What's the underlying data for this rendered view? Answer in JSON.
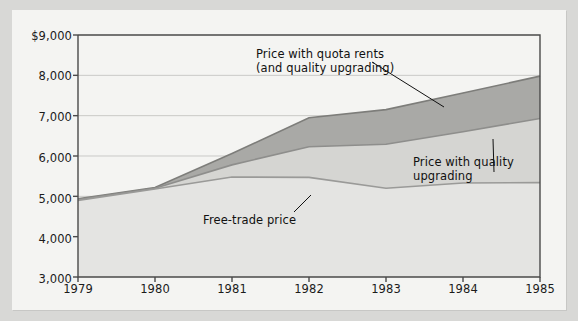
{
  "chart_data": {
    "type": "area",
    "title": "",
    "subtitle": "",
    "xlabel": "",
    "ylabel": "",
    "stacked": true,
    "grid": true,
    "legend_position": "inline-annotations",
    "x": [
      1979,
      1980,
      1981,
      1982,
      1983,
      1984,
      1985
    ],
    "categories": [
      "1979",
      "1980",
      "1981",
      "1982",
      "1983",
      "1984",
      "1985"
    ],
    "xlim": [
      1979,
      1985
    ],
    "ylim": [
      3000,
      9000
    ],
    "ytick_values": [
      3000,
      4000,
      5000,
      6000,
      7000,
      8000,
      9000
    ],
    "ytick_labels": [
      "3,000",
      "4,000",
      "5,000",
      "6,000",
      "7,000",
      "8,000",
      "$9,000"
    ],
    "xtick_labels": [
      "1979",
      "1980",
      "1981",
      "1982",
      "1983",
      "1984",
      "1985"
    ],
    "series": [
      {
        "name": "Free-trade price",
        "values": [
          4900,
          5180,
          5480,
          5470,
          5200,
          5330,
          5340
        ],
        "color": "#e4e4e2",
        "line_color": "#9a9a98"
      },
      {
        "name": "Price with quality upgrading",
        "values": [
          4920,
          5200,
          5780,
          6230,
          6290,
          6600,
          6930
        ],
        "color": "#d5d5d2",
        "line_color": "#8e8e8c"
      },
      {
        "name": "Price with quota rents (and quality upgrading)",
        "values": [
          4940,
          5220,
          6060,
          6950,
          7150,
          7560,
          7980
        ],
        "color": "#a9a9a6",
        "line_color": "#7d7d7a"
      }
    ],
    "annotations": [
      {
        "id": "quota-rents-annotation",
        "line1": "Price with quota rents",
        "line2": "(and quality upgrading)",
        "x": 256,
        "y": 47,
        "leader": {
          "x1": 372,
          "y1": 62,
          "x2": 444,
          "y2": 107
        }
      },
      {
        "id": "quality-upgrading-annotation",
        "line1": "Price with quality",
        "line2": "upgrading",
        "x": 413,
        "y": 155,
        "leader": {
          "x1": 494,
          "y1": 172,
          "x2": 493,
          "y2": 139
        }
      },
      {
        "id": "free-trade-price-annotation",
        "line1": "Free-trade price",
        "line2": "",
        "x": 203,
        "y": 213,
        "leader": {
          "x1": 294,
          "y1": 212,
          "x2": 311,
          "y2": 195
        }
      }
    ],
    "colors": {
      "background": "#d8d8d6",
      "paper": "#f4f4f2",
      "axis": "#4a4a4a",
      "gridline": "#c9c9c7",
      "text": "#1b1b1b"
    }
  }
}
